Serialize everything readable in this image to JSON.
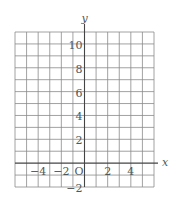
{
  "diagram": {
    "type": "coordinate-grid",
    "x_axis": {
      "label": "x",
      "min": -6,
      "max": 6,
      "tick_labels": [
        "−4",
        "−2",
        "2",
        "4"
      ],
      "tick_values": [
        -4,
        -2,
        2,
        4
      ]
    },
    "y_axis": {
      "label": "y",
      "min": -2,
      "max": 11,
      "tick_labels": [
        "10",
        "8",
        "6",
        "4",
        "2",
        "−2"
      ],
      "tick_values": [
        10,
        8,
        6,
        4,
        2,
        -2
      ]
    },
    "origin_label": "O",
    "grid": {
      "step": 1,
      "line_color": "#8a8a8a",
      "axis_color": "#444444"
    }
  }
}
